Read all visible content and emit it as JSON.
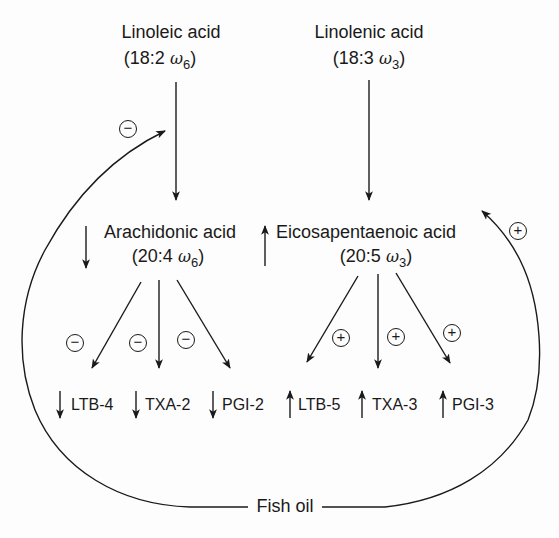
{
  "diagram": {
    "type": "metabolic pathway",
    "precursors": {
      "omega6": {
        "name": "Linoleic acid",
        "notation_prefix": "(18:2 ",
        "omega": "ω",
        "omega_sub": "6",
        "notation_suffix": ")"
      },
      "omega3": {
        "name": "Linolenic acid",
        "notation_prefix": "(18:3 ",
        "omega": "ω",
        "omega_sub": "3",
        "notation_suffix": ")"
      }
    },
    "intermediates": {
      "omega6": {
        "name": "Arachidonic acid",
        "notation_prefix": "(20:4 ",
        "omega": "ω",
        "omega_sub": "6",
        "notation_suffix": ")",
        "trend": "down"
      },
      "omega3": {
        "name": "Eicosapentaenoic acid",
        "notation_prefix": "(20:5 ",
        "omega": "ω",
        "omega_sub": "3",
        "notation_suffix": ")",
        "trend": "up"
      }
    },
    "products_omega6": [
      {
        "label": "LTB-4",
        "trend": "down",
        "effect": "−"
      },
      {
        "label": "TXA-2",
        "trend": "down",
        "effect": "−"
      },
      {
        "label": "PGI-2",
        "trend": "down",
        "effect": "−"
      }
    ],
    "products_omega3": [
      {
        "label": "LTB-5",
        "trend": "up",
        "effect": "+"
      },
      {
        "label": "TXA-3",
        "trend": "up",
        "effect": "+"
      },
      {
        "label": "PGI-3",
        "trend": "up",
        "effect": "+"
      }
    ],
    "modulator": {
      "label": "Fish oil",
      "effect_on_omega6_pathway": "−",
      "effect_on_omega3_pathway": "+"
    },
    "colors": {
      "ink": "#1a1a1a",
      "background": "#fdfdfd"
    }
  }
}
